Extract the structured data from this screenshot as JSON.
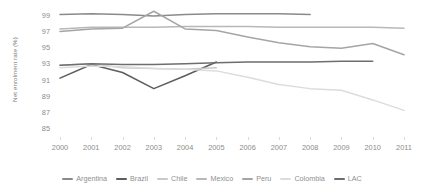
{
  "chart_data": {
    "type": "line",
    "title": "",
    "xlabel": "",
    "ylabel": "Net enrolment rate (%)",
    "x": [
      2000,
      2001,
      2002,
      2003,
      2004,
      2005,
      2006,
      2007,
      2008,
      2009,
      2010,
      2011
    ],
    "xticklabels": [
      "2000",
      "2001",
      "2002",
      "2003",
      "2004",
      "2005",
      "2006",
      "2007",
      "2008",
      "2009",
      "2010",
      "2011"
    ],
    "yticklabels": [
      "99",
      "97",
      "95",
      "93",
      "91",
      "89",
      "87",
      "85"
    ],
    "ylim": [
      84,
      100
    ],
    "ytick_values": [
      99,
      97,
      95,
      93,
      91,
      89,
      87,
      85
    ],
    "grid": false,
    "legend_position": "bottom",
    "series": [
      {
        "name": "Argentina",
        "color": "#8a8a8a",
        "values": [
          99.2,
          99.3,
          99.2,
          99.0,
          99.2,
          99.3,
          99.3,
          99.3,
          99.2,
          null,
          null,
          null
        ]
      },
      {
        "name": "Brazil",
        "color": "#5d5d5d",
        "values": [
          91.3,
          93.0,
          92.0,
          90.0,
          91.6,
          93.3,
          null,
          null,
          null,
          null,
          null,
          null
        ]
      },
      {
        "name": "Chile",
        "color": "#c9c9c9",
        "values": [
          92.9,
          93.1,
          92.6,
          92.5,
          92.4,
          92.6,
          null,
          null,
          null,
          null,
          null,
          null
        ]
      },
      {
        "name": "Mexico",
        "color": "#b8b8b8",
        "values": [
          97.4,
          97.6,
          97.6,
          97.6,
          97.7,
          97.7,
          97.7,
          97.6,
          97.6,
          97.6,
          97.6,
          97.5
        ]
      },
      {
        "name": "Peru",
        "color": "#a5a5a5",
        "values": [
          97.1,
          97.4,
          97.5,
          99.6,
          97.4,
          97.2,
          96.4,
          95.7,
          95.2,
          95.0,
          95.6,
          94.2
        ]
      },
      {
        "name": "Colombia",
        "color": "#dcdcdc",
        "values": [
          92.6,
          92.8,
          92.7,
          92.5,
          92.4,
          92.2,
          91.4,
          90.5,
          90.0,
          89.8,
          88.6,
          87.3
        ]
      },
      {
        "name": "LAC",
        "color": "#6e6e6e",
        "values": [
          92.9,
          93.1,
          93.0,
          93.0,
          93.1,
          93.2,
          93.3,
          93.3,
          93.3,
          93.4,
          93.4,
          null
        ]
      }
    ]
  }
}
